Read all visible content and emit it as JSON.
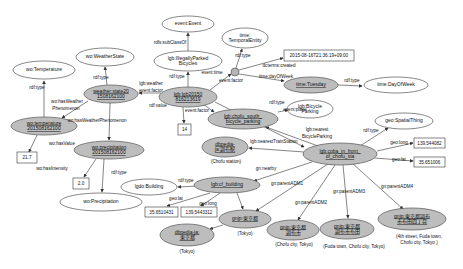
{
  "figure": {
    "background": "#ffffff",
    "colors": {
      "class_node_fill": "#ffffff",
      "instance_node_fill": "#bdbdbd",
      "edge_stroke": "#333333",
      "literal_box_fill": "#ffffff"
    }
  },
  "graph": {
    "nodes": [
      {
        "id": "wo-temperature-class",
        "kind": "class",
        "shape": "ellipse",
        "cx": 44,
        "cy": 70,
        "rx": 31,
        "ry": 9,
        "lines": [
          "wo:Temperature"
        ]
      },
      {
        "id": "wo-weatherstate-class",
        "kind": "class",
        "shape": "ellipse",
        "cx": 105,
        "cy": 57,
        "rx": 29,
        "ry": 9,
        "lines": [
          "wo:WeatherState"
        ]
      },
      {
        "id": "event-event-class",
        "kind": "class",
        "shape": "ellipse",
        "cx": 188,
        "cy": 24,
        "rx": 26,
        "ry": 8,
        "lines": [
          "event:Event"
        ]
      },
      {
        "id": "time-temporalentity-class",
        "kind": "class",
        "shape": "ellipse",
        "cx": 245,
        "cy": 38,
        "rx": 23,
        "ry": 10,
        "lines": [
          "time:",
          "TemporalEntity"
        ]
      },
      {
        "id": "time-dayofweek-class",
        "kind": "class",
        "shape": "ellipse",
        "cx": 396,
        "cy": 85,
        "rx": 32,
        "ry": 8,
        "lines": [
          "time:DayOfWeek"
        ]
      },
      {
        "id": "lgb-illegallyparked-class",
        "kind": "class",
        "shape": "ellipse",
        "cx": 188,
        "cy": 61,
        "rx": 34,
        "ry": 10,
        "lines": [
          "lgb:IllegallyParked",
          "Bicycles"
        ]
      },
      {
        "id": "lgb-bicycleparking-class",
        "kind": "class",
        "shape": "ellipse",
        "cx": 310,
        "cy": 109,
        "rx": 23,
        "ry": 9,
        "lines": [
          "lgb:Bicycle",
          "Parking"
        ]
      },
      {
        "id": "geo-spatialthing-class",
        "kind": "class",
        "shape": "ellipse",
        "cx": 404,
        "cy": 121,
        "rx": 29,
        "ry": 8,
        "lines": [
          "geo:SpatialThing"
        ]
      },
      {
        "id": "lgdo-building-class",
        "kind": "class",
        "shape": "ellipse",
        "cx": 149,
        "cy": 187,
        "rx": 28,
        "ry": 8,
        "lines": [
          "lgdo:Building"
        ]
      },
      {
        "id": "wo-precipitation-class",
        "kind": "class",
        "shape": "ellipse",
        "cx": 101,
        "cy": 202,
        "rx": 41,
        "ry": 9,
        "lines": [
          "wo:Precipitation"
        ]
      },
      {
        "id": "weather-state-instance",
        "kind": "instance",
        "shape": "ellipse",
        "cx": 111,
        "cy": 94,
        "rx": 27,
        "ry": 9,
        "lines": [
          "weather:state20",
          "1508162100"
        ]
      },
      {
        "id": "wo-temperature-instance",
        "kind": "instance",
        "shape": "ellipse",
        "cx": 44,
        "cy": 126,
        "rx": 33,
        "ry": 9,
        "lines": [
          "wo:temperature",
          "201508162100"
        ]
      },
      {
        "id": "wo-precipitation-instance",
        "kind": "instance",
        "shape": "ellipse",
        "cx": 109,
        "cy": 150,
        "rx": 35,
        "ry": 9,
        "lines": [
          "wo:precipitation",
          "201508162100"
        ]
      },
      {
        "id": "lgb-event-instance",
        "kind": "instance",
        "shape": "ellipse",
        "cx": 188,
        "cy": 97,
        "rx": 29,
        "ry": 10,
        "lines": [
          "lgb:lgb20150",
          "816213619"
        ]
      },
      {
        "id": "chofu-south-parking-instance",
        "kind": "instance",
        "shape": "ellipse",
        "cx": 243,
        "cy": 119,
        "rx": 35,
        "ry": 10,
        "lines": [
          "lgb:chofu_south_",
          "bicycle_parking"
        ]
      },
      {
        "id": "time-tuesday-instance",
        "kind": "instance",
        "shape": "ellipse",
        "cx": 311,
        "cy": 85,
        "rx": 27,
        "ry": 8,
        "lines": [
          "time:Tuesday"
        ]
      },
      {
        "id": "dbpedia-chofu-station-instance",
        "kind": "instance",
        "shape": "ellipse",
        "cx": 225,
        "cy": 147,
        "rx": 23,
        "ry": 10,
        "lines": [
          "dbpedia-",
          "ja:調布駅"
        ]
      },
      {
        "id": "lgb-coba-instance",
        "kind": "instance",
        "shape": "ellipse",
        "cx": 340,
        "cy": 154,
        "rx": 37,
        "ry": 11,
        "lines": [
          "lgb:coba_in_front_",
          "of_chofu_sta"
        ]
      },
      {
        "id": "lgb-cf-building-instance",
        "kind": "instance",
        "shape": "ellipse",
        "cx": 227,
        "cy": 185,
        "rx": 33,
        "ry": 8,
        "lines": [
          "lgb:cf_building"
        ]
      },
      {
        "id": "dbpedia-tokyo-instance",
        "kind": "instance",
        "shape": "ellipse",
        "cx": 187,
        "cy": 235,
        "rx": 27,
        "ry": 11,
        "lines": [
          "dbpedia-ja:",
          "東京都"
        ]
      },
      {
        "id": "gnjp-tokyo-instance",
        "kind": "instance",
        "shape": "ellipse",
        "cx": 245,
        "cy": 219,
        "rx": 26,
        "ry": 9,
        "lines": [
          "gnjp:東京都"
        ]
      },
      {
        "id": "gnjp-chofu-instance",
        "kind": "instance",
        "shape": "ellipse",
        "cx": 293,
        "cy": 230,
        "rx": 26,
        "ry": 10,
        "lines": [
          "gnjp:東京都",
          "調布市"
        ]
      },
      {
        "id": "gnjp-fuda-instance",
        "kind": "instance",
        "shape": "ellipse",
        "cx": 347,
        "cy": 229,
        "rx": 27,
        "ry": 10,
        "lines": [
          "gnjp:東京都",
          "調布市布田"
        ]
      },
      {
        "id": "gnjp-fuda4-instance",
        "kind": "instance",
        "shape": "ellipse",
        "cx": 412,
        "cy": 219,
        "rx": 34,
        "ry": 11,
        "lines": [
          "gnjp:東京都調布",
          "市布田四丁目"
        ]
      },
      {
        "id": "time-blank-node",
        "kind": "blank",
        "shape": "circle",
        "cx": 235,
        "cy": 72,
        "r": 4,
        "lines": []
      }
    ],
    "literals": [
      {
        "id": "temperature-value",
        "x": 17,
        "y": 152,
        "w": 20,
        "h": 11,
        "text": "21.7"
      },
      {
        "id": "precipitation-intensity-value",
        "x": 73,
        "y": 178,
        "w": 16,
        "h": 11,
        "text": "2.0"
      },
      {
        "id": "bicycle-count-value",
        "x": 178,
        "y": 124,
        "w": 13,
        "h": 11,
        "text": "14"
      },
      {
        "id": "created-datetime-value",
        "x": 284,
        "y": 50,
        "w": 70,
        "h": 11,
        "text": "2015-08-16T21:36:19+09:00"
      },
      {
        "id": "coba-longitude-value",
        "x": 414,
        "y": 138,
        "w": 31,
        "h": 10,
        "text": "139.544082"
      },
      {
        "id": "coba-latitude-value",
        "x": 414,
        "y": 157,
        "w": 31,
        "h": 10,
        "text": "35.651006"
      },
      {
        "id": "building-latitude-value",
        "x": 145,
        "y": 207,
        "w": 33,
        "h": 10,
        "text": "35.6510431"
      },
      {
        "id": "building-longitude-value",
        "x": 181,
        "y": 207,
        "w": 36,
        "h": 10,
        "text": "139.5443312"
      }
    ],
    "edges": [
      {
        "name": "temperature-rdf-type",
        "p": [
          44,
          117,
          44,
          81
        ]
      },
      {
        "name": "temperature-hasvalue",
        "p": [
          37,
          135,
          29,
          152
        ]
      },
      {
        "name": "weatherstate-rdf-type",
        "p": [
          107,
          85,
          105,
          67
        ]
      },
      {
        "name": "weatherstate-hasweatherphenomenon-temp",
        "p": [
          88,
          101,
          62,
          118
        ]
      },
      {
        "name": "weatherstate-hasweatherphenomenon-precip",
        "p": [
          110,
          103,
          109,
          140
        ]
      },
      {
        "name": "precipitation-rdf-type",
        "p": [
          104,
          159,
          102,
          192
        ]
      },
      {
        "name": "precipitation-hasintensity",
        "p": [
          96,
          159,
          84,
          177
        ]
      },
      {
        "name": "illegallyparked-subclassof",
        "p": [
          188,
          51,
          188,
          33
        ]
      },
      {
        "name": "event-rdf-type",
        "p": [
          188,
          87,
          188,
          72
        ]
      },
      {
        "name": "event-weather-factor",
        "p": [
          161,
          93,
          139,
          93
        ]
      },
      {
        "name": "event-rdf-value",
        "p": [
          183,
          107,
          184,
          123
        ]
      },
      {
        "name": "event-time",
        "p": [
          210,
          90,
          231,
          74
        ]
      },
      {
        "name": "blank-rdf-type",
        "p": [
          236,
          68,
          242,
          49
        ]
      },
      {
        "name": "blank-dcterms-created",
        "p": [
          239,
          70,
          283,
          58
        ]
      },
      {
        "name": "blank-dayofweek",
        "p": [
          239,
          74,
          284,
          81
        ]
      },
      {
        "name": "tuesday-rdf-type",
        "p": [
          338,
          85,
          362,
          86
        ]
      },
      {
        "name": "event-factor-parking",
        "p": [
          203,
          104,
          214,
          112
        ]
      },
      {
        "name": "event-place",
        "p": [
          215,
          102,
          304,
          147
        ]
      },
      {
        "name": "parking-rdf-type",
        "p": [
          278,
          112,
          288,
          110
        ]
      },
      {
        "name": "coba-nearest-bicycleparking",
        "p": [
          318,
          146,
          266,
          127
        ]
      },
      {
        "name": "coba-nearest-trainstation",
        "p": [
          304,
          152,
          249,
          148
        ]
      },
      {
        "name": "coba-rdf-type",
        "p": [
          360,
          146,
          388,
          128
        ]
      },
      {
        "name": "coba-geo-long",
        "p": [
          377,
          151,
          413,
          143
        ]
      },
      {
        "name": "coba-geo-lat",
        "p": [
          375,
          158,
          413,
          161
        ]
      },
      {
        "name": "coba-gn-nearby",
        "p": [
          312,
          162,
          254,
          181
        ]
      },
      {
        "name": "coba-parent-adm1",
        "p": [
          328,
          164,
          256,
          211
        ]
      },
      {
        "name": "coba-parent-adm2",
        "p": [
          335,
          165,
          298,
          220
        ]
      },
      {
        "name": "coba-parent-adm3",
        "p": [
          343,
          165,
          348,
          218
        ]
      },
      {
        "name": "coba-parent-adm4",
        "p": [
          352,
          163,
          403,
          209
        ]
      },
      {
        "name": "building-rdf-type",
        "p": [
          198,
          186,
          178,
          187
        ]
      },
      {
        "name": "building-geo-lat",
        "p": [
          210,
          193,
          167,
          206
        ]
      },
      {
        "name": "building-geo-long",
        "p": [
          220,
          193,
          201,
          206
        ]
      },
      {
        "name": "building-to-gnjp-tokyo",
        "p": [
          237,
          193,
          243,
          209
        ]
      },
      {
        "name": "gnjp-tokyo-to-dbpedia",
        "p": [
          223,
          225,
          210,
          229
        ]
      }
    ],
    "edge_labels": [
      {
        "text": "rdf:type",
        "x": 37,
        "y": 89
      },
      {
        "text": "rdf:type",
        "x": 101,
        "y": 79
      },
      {
        "text": "wo:hasWeather",
        "x": 67,
        "y": 103
      },
      {
        "text": "Phenomenon",
        "x": 66,
        "y": 110
      },
      {
        "text": "wo:hasWeatherPhenomenon",
        "x": 97,
        "y": 122
      },
      {
        "text": "wo:hasValue",
        "x": 62,
        "y": 145
      },
      {
        "text": "wo:hasIntensity",
        "x": 52,
        "y": 170
      },
      {
        "text": "rdf:type",
        "x": 119,
        "y": 174
      },
      {
        "text": "rdfs:subClassOf",
        "x": 170,
        "y": 44
      },
      {
        "text": "rdf:type",
        "x": 177,
        "y": 78
      },
      {
        "text": "lgb:weather",
        "x": 151,
        "y": 85
      },
      {
        "text": "event:factor",
        "x": 151,
        "y": 92
      },
      {
        "text": "rdf:value",
        "x": 158,
        "y": 107
      },
      {
        "text": "event:time",
        "x": 212,
        "y": 74
      },
      {
        "text": "event:factor",
        "x": 231,
        "y": 82
      },
      {
        "text": "event:factor",
        "x": 197,
        "y": 112
      },
      {
        "text": "rdf:type",
        "x": 243,
        "y": 57
      },
      {
        "text": "dcterms:created",
        "x": 279,
        "y": 67
      },
      {
        "text": "time:dayOfWeek",
        "x": 276,
        "y": 78
      },
      {
        "text": "rdf:type",
        "x": 352,
        "y": 82
      },
      {
        "text": "rdf:type",
        "x": 277,
        "y": 104
      },
      {
        "text": "event:place",
        "x": 295,
        "y": 111
      },
      {
        "text": "lgb:nearest",
        "x": 317,
        "y": 131
      },
      {
        "text": "BicycleParking",
        "x": 317,
        "y": 138
      },
      {
        "text": "lgb:nearestTrainStation",
        "x": 274,
        "y": 143
      },
      {
        "text": "gn:nearby",
        "x": 266,
        "y": 170
      },
      {
        "text": "rdf:type",
        "x": 371,
        "y": 132
      },
      {
        "text": "geo:long",
        "x": 399,
        "y": 144
      },
      {
        "text": "geo:lat",
        "x": 399,
        "y": 161
      },
      {
        "text": "gn:parentADM1",
        "x": 287,
        "y": 185
      },
      {
        "text": "gn:parentADM2",
        "x": 311,
        "y": 204
      },
      {
        "text": "gn:parentADM3",
        "x": 349,
        "y": 193
      },
      {
        "text": "gn:parentADM4",
        "x": 397,
        "y": 188
      },
      {
        "text": "rdf:type",
        "x": 186,
        "y": 182
      },
      {
        "text": "geo:lat",
        "x": 176,
        "y": 200
      },
      {
        "text": "geo:long",
        "x": 208,
        "y": 205
      }
    ],
    "captions": [
      {
        "id": "chofu-station-caption",
        "x": 226,
        "y": 163,
        "lines": [
          "(Chofu station)"
        ]
      },
      {
        "id": "dbpedia-tokyo-caption",
        "x": 187,
        "y": 253,
        "lines": [
          "(Tokyo)"
        ]
      },
      {
        "id": "gnjp-tokyo-caption",
        "x": 245,
        "y": 235,
        "lines": [
          "(Tokyo)"
        ]
      },
      {
        "id": "gnjp-chofu-caption",
        "x": 294,
        "y": 246,
        "lines": [
          "(Chofu city, Tokyo)"
        ]
      },
      {
        "id": "gnjp-fuda-caption",
        "x": 354,
        "y": 248,
        "lines": [
          "(Fuda town, Chofu city, Tokyo)"
        ]
      },
      {
        "id": "gnjp-fuda4-caption",
        "x": 419,
        "y": 238,
        "lines": [
          "(4th street, Fuda town,",
          "Chofu city, Tokyo )"
        ]
      }
    ]
  }
}
